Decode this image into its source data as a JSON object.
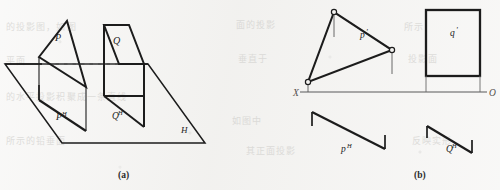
{
  "figure": {
    "title_a": "(a)",
    "title_b": "(b)",
    "caption_a_x": 118,
    "caption_a_y": 170,
    "caption_b_x": 414,
    "caption_b_y": 170
  },
  "colors": {
    "ink": "#1c1c1c",
    "ink_thin": "#3a3a3a",
    "axis_gray": "#8d8d8d",
    "paper": "#f3f2f0",
    "ghost": "#c9c8c5",
    "dashed": "#6f6f6f"
  },
  "pictorial": {
    "plane_h_label": "H",
    "plane_h_label_x": 181,
    "plane_h_label_y": 133,
    "plane_p_label": "P",
    "plane_p_label_x": 55,
    "plane_p_label_y": 41,
    "plane_q_label": "Q",
    "plane_q_label_x": 113,
    "plane_q_label_y": 44,
    "trace_p_label": "P",
    "trace_p_sup": "H",
    "trace_p_label_x": 56,
    "trace_p_label_y": 120,
    "trace_q_label": "Q",
    "trace_q_sup": "H",
    "trace_q_label_x": 112,
    "trace_q_label_y": 119,
    "plane_h_outline": "M 5,64 L 148,64 L 205,143 L 62,143 Z",
    "back_edge_solid_left": "M 5,64 L 42,64",
    "back_edge_dashed": "M 42,64 L 140,64",
    "back_edge_solid_right": "M 140,64 L 148,64",
    "triangle_p": "M 39,57 L 67,21 L 86,87 Z",
    "triangle_p_drop_left": "M 39,57 L 39,100",
    "triangle_p_drop_right": "M 86,87 L 86,131",
    "trace_p": "M 39,100 L 86,131",
    "trace_p_tick_left": "M 39,100 L 39,85",
    "parallelogram_q": "M 104,25 L 129,25 L 144,64 L 119,64 Z",
    "parallelogram_q_lower": "M 119,64 L 144,64 L 144,96 L 119,96 Z",
    "trace_q": "M 104,96 L 144,96",
    "trace_q_left_edge": "M 104,25 L 104,96",
    "trace_q_right_edge": "M 144,64 L 144,127",
    "trace_q_base": "M 104,96 L 144,127"
  },
  "orthographic": {
    "axis_label_left": "X",
    "axis_label_right": "O",
    "axis_label_left_x": 293,
    "axis_label_left_y": 96,
    "axis_label_right_x": 489,
    "axis_label_right_y": 96,
    "axis_line": "M 300,92 L 487,92",
    "frontal_p_label": "p",
    "frontal_p_prime": "'",
    "frontal_p_label_x": 360,
    "frontal_p_label_y": 38,
    "frontal_q_label": "q",
    "frontal_q_prime": "'",
    "frontal_q_label_x": 457,
    "frontal_q_label_y": 34,
    "horizontal_p_label": "p",
    "horizontal_p_sup": "H",
    "horizontal_p_label_x": 341,
    "horizontal_p_label_y": 152,
    "horizontal_q_label": "Q",
    "horizontal_q_sup": "H",
    "horizontal_q_label_x": 446,
    "horizontal_q_label_y": 152,
    "triangle_p_prime": "M 308,82 L 334,12 L 392,50 Z",
    "vertex_apex": {
      "cx": 334,
      "cy": 12,
      "r": 2.6
    },
    "vertex_right": {
      "cx": 392,
      "cy": 50,
      "r": 2.6
    },
    "vertex_left": {
      "cx": 308,
      "cy": 82,
      "r": 2.6
    },
    "drop_apex": "M 334,15 L 334,37",
    "drop_right": "M 392,53 L 392,74",
    "drop_left": "M 308,85 L 308,92",
    "rect_q_prime": {
      "x": 426,
      "y": 10,
      "w": 54,
      "h": 66
    },
    "drop_q_left": "M 426,76 L 426,92",
    "drop_q_right": "M 480,76 L 480,92",
    "trace_p_h": "M 312,112 L 385,149",
    "trace_p_h_tick_left": "M 312,112 L 312,126",
    "trace_p_h_tick_right": "M 385,149 L 385,135",
    "trace_q_h": "M 427,126 L 472,153",
    "trace_q_h_tick_left": "M 427,126 L 427,138",
    "trace_q_h_tick_right": "M 472,153 L 472,140"
  },
  "ghost_text": [
    {
      "text": "的投影图，如图",
      "x": 6,
      "y": 26
    },
    {
      "text": "面的投影",
      "x": 236,
      "y": 24
    },
    {
      "text": "所示",
      "x": 404,
      "y": 26
    },
    {
      "text": "平面",
      "x": 6,
      "y": 60
    },
    {
      "text": "垂直于",
      "x": 238,
      "y": 58
    },
    {
      "text": "投影面",
      "x": 408,
      "y": 58
    },
    {
      "text": "的水平投影积聚成一条直线",
      "x": 6,
      "y": 96
    },
    {
      "text": "如图中",
      "x": 232,
      "y": 120
    },
    {
      "text": "所示的铅垂面",
      "x": 6,
      "y": 140
    },
    {
      "text": "其正面投影",
      "x": 246,
      "y": 150
    },
    {
      "text": "反映实形",
      "x": 412,
      "y": 140
    }
  ]
}
